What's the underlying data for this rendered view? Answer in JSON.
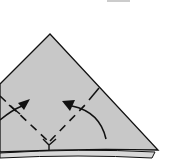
{
  "diagram": {
    "type": "origami-fold-step",
    "paper_color": "#c8c8c8",
    "line_color": "#111111",
    "background": "#ffffff",
    "elements": [
      {
        "name": "paper-triangle",
        "shape": "triangle"
      },
      {
        "name": "left-fold-arrow",
        "direction": "up-right"
      },
      {
        "name": "right-fold-arrow",
        "direction": "up-left"
      },
      {
        "name": "valley-fold-left",
        "style": "dashed"
      },
      {
        "name": "valley-fold-right",
        "style": "dashed"
      },
      {
        "name": "reference-tick-right",
        "style": "solid"
      },
      {
        "name": "reference-tick-left",
        "style": "solid"
      }
    ]
  }
}
